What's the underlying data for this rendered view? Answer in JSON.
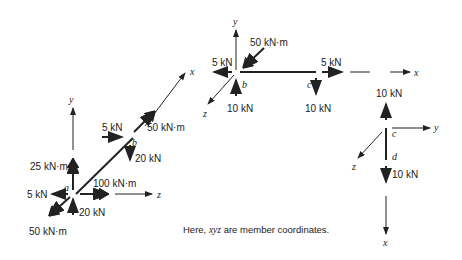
{
  "figure_a": {
    "node_a": "a",
    "node_b": "b",
    "axes": {
      "x": "x",
      "y": "y",
      "z": "z"
    },
    "loads": {
      "a_moment_y": "25 kN·m",
      "a_force_x": "5 kN",
      "a_moment_z": "100 kN·m",
      "a_force_y": "20 kN",
      "a_moment_x": "50 kN·m",
      "b_force": "5 kN",
      "b_moment": "50 kN·m",
      "b_force_down": "20 kN"
    }
  },
  "figure_b": {
    "node_b": "b",
    "node_c": "c",
    "axes": {
      "x": "x",
      "y": "y",
      "z": "z"
    },
    "loads": {
      "b_moment": "50 kN·m",
      "b_force_left": "5 kN",
      "b_force_up": "10 kN",
      "c_force_right": "5 kN",
      "c_force_down": "10 kN"
    }
  },
  "figure_c": {
    "node_c": "c",
    "node_d": "d",
    "axes": {
      "x": "x",
      "y": "y",
      "z": "z"
    },
    "loads": {
      "c_force_up": "10 kN",
      "d_force_down": "10 kN"
    }
  },
  "caption": {
    "prefix": "Here, ",
    "coords": "xyz",
    "suffix": " are member coordinates."
  }
}
